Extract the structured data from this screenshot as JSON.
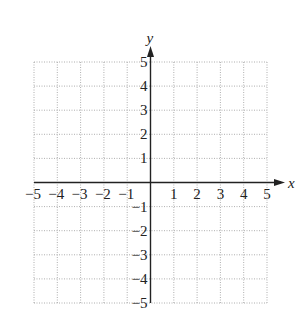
{
  "chart_data": {
    "type": "scatter",
    "title": "",
    "xlabel": "x",
    "ylabel": "y",
    "xlim": [
      -5,
      5
    ],
    "ylim": [
      -5,
      5
    ],
    "grid": true,
    "grid_style": "dotted",
    "x_ticks": [
      -5,
      -4,
      -3,
      -2,
      -1,
      1,
      2,
      3,
      4,
      5
    ],
    "y_ticks": [
      -5,
      -4,
      -3,
      -2,
      -1,
      1,
      2,
      3,
      4,
      5
    ],
    "x_tick_labels": [
      "−5",
      "−4",
      "−3",
      "−2",
      "−1",
      "1",
      "2",
      "3",
      "4",
      "5"
    ],
    "y_tick_labels": [
      "−5",
      "−4",
      "−3",
      "−2",
      "−1",
      "1",
      "2",
      "3",
      "4",
      "5"
    ],
    "series": [],
    "legend": null
  },
  "colors": {
    "axis": "#222222",
    "grid": "#9a9a9a",
    "background": "#ffffff"
  },
  "layout": {
    "grid_left": 34,
    "grid_right": 267,
    "grid_top": 62,
    "grid_bottom": 303,
    "origin_x": 151,
    "origin_y": 182
  }
}
